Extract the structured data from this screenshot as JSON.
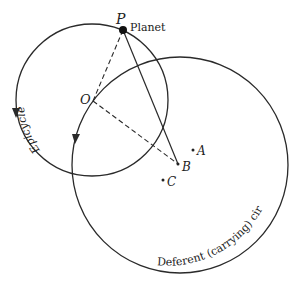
{
  "labels": {
    "P": "P",
    "planet": "Planet",
    "O": "O",
    "A": "A",
    "B": "B",
    "C": "C",
    "epicycle": "Epicycle",
    "deferent": "Deferent (carrying) circle"
  },
  "colors": {
    "line": "#2a2a2a",
    "background": "#ffffff"
  }
}
